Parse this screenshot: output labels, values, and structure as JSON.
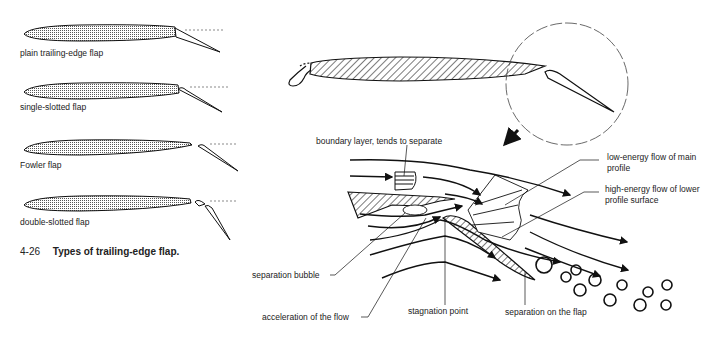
{
  "flap_types": [
    {
      "label": "plain trailing-edge flap"
    },
    {
      "label": "single-slotted flap"
    },
    {
      "label": "Fowler flap"
    },
    {
      "label": "double-slotted flap"
    }
  ],
  "caption": {
    "number": "4-26",
    "title": "Types of trailing-edge flap."
  },
  "annotations": {
    "boundary_layer": "boundary layer, tends to separate",
    "low_energy_1": "low-energy flow of main",
    "low_energy_2": "profile",
    "high_energy_1": "high-energy flow of lower",
    "high_energy_2": "profile surface",
    "separation_bubble": "separation bubble",
    "acceleration": "acceleration of the flow",
    "stagnation": "stagnation point",
    "separation_flap": "separation on the flap"
  },
  "colors": {
    "ink": "#1a1a1a",
    "hatch": "#333333",
    "background": "#ffffff"
  }
}
